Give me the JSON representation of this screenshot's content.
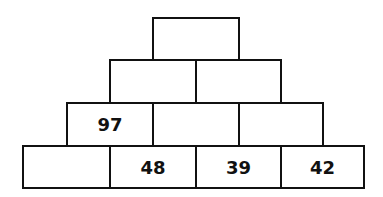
{
  "pyramid": {
    "rows": [
      {
        "cells": [
          ""
        ]
      },
      {
        "cells": [
          "",
          ""
        ]
      },
      {
        "cells": [
          "97",
          "",
          ""
        ]
      },
      {
        "cells": [
          "",
          "48",
          "39",
          "42"
        ]
      }
    ]
  },
  "colors": {
    "border": "#111111",
    "background": "#ffffff",
    "text": "#111111"
  }
}
